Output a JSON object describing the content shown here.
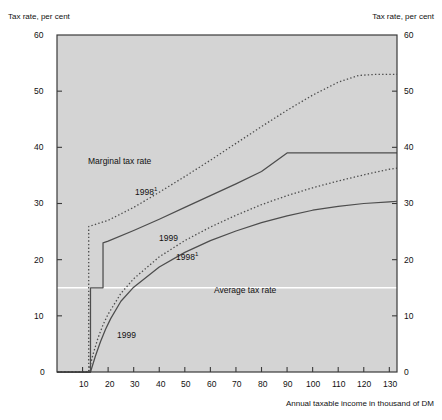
{
  "figure": {
    "y_axis_title_left": "Tax rate, per cent",
    "y_axis_title_right": "Tax rate, per cent",
    "x_axis_title": "Annual taxable income in thousand of DM"
  },
  "annotations": {
    "marginal_group": "Marginal tax rate",
    "marginal_1998": "1998",
    "marginal_1998_sup": "1",
    "marginal_1999": "1999",
    "average_1998": "1998",
    "average_1998_sup": "1",
    "average_group": "Average tax rate",
    "average_1999": "1999"
  },
  "colors": {
    "plot_background": "#d4d4d4",
    "line": "#4d4d4d",
    "axis": "#3a3a3a",
    "gridline": "#ffffff",
    "text": "#111111"
  },
  "chart_data": {
    "type": "line",
    "title": "",
    "xlabel": "Annual taxable income in thousand of DM",
    "ylabel": "Tax rate, per cent",
    "xlim": [
      0,
      133
    ],
    "ylim": [
      0,
      60
    ],
    "xticks": [
      10,
      20,
      30,
      40,
      50,
      60,
      70,
      80,
      90,
      100,
      110,
      120,
      130
    ],
    "yticks": [
      0,
      10,
      20,
      30,
      40,
      50,
      60
    ],
    "grid": "single white horizontal line at y = 15",
    "gridlines_y": [
      15
    ],
    "legend": "inline annotations",
    "series": [
      {
        "name": "Marginal tax rate 1998",
        "style": "dotted",
        "x": [
          0,
          12.4,
          12.4,
          20,
          30,
          40,
          50,
          60,
          70,
          80,
          90,
          100,
          110,
          118,
          125,
          133
        ],
        "values": [
          0,
          0,
          25.9,
          27.0,
          29.3,
          32.0,
          34.8,
          37.7,
          40.7,
          43.7,
          46.6,
          49.3,
          51.6,
          52.8,
          53.0,
          53.0
        ]
      },
      {
        "name": "Marginal tax rate 1999",
        "style": "solid",
        "x": [
          0,
          13.1,
          13.1,
          18.0,
          18.0,
          20,
          30,
          40,
          50,
          60,
          70,
          80,
          90,
          100,
          110,
          120,
          133
        ],
        "values": [
          0,
          0,
          15.0,
          15.0,
          23.0,
          23.3,
          25.2,
          27.2,
          29.3,
          31.4,
          33.5,
          35.7,
          39.0,
          39.0,
          39.0,
          39.0,
          39.0
        ]
      },
      {
        "name": "Average tax rate 1998",
        "style": "dotted",
        "x": [
          0,
          12.4,
          14,
          16,
          18,
          20,
          25,
          30,
          40,
          50,
          60,
          70,
          80,
          90,
          100,
          110,
          120,
          130,
          133
        ],
        "values": [
          0,
          0,
          3.0,
          6.0,
          8.4,
          10.3,
          14.0,
          16.6,
          20.5,
          23.4,
          25.8,
          27.9,
          29.8,
          31.4,
          32.8,
          34.0,
          35.1,
          36.1,
          36.3
        ]
      },
      {
        "name": "Average tax rate 1999",
        "style": "solid",
        "x": [
          0,
          13.1,
          15,
          17,
          19,
          21,
          25,
          30,
          40,
          50,
          60,
          70,
          80,
          90,
          100,
          110,
          120,
          130,
          133
        ],
        "values": [
          0,
          0,
          2.8,
          5.4,
          7.6,
          9.5,
          12.6,
          15.1,
          18.7,
          21.3,
          23.4,
          25.1,
          26.6,
          27.8,
          28.8,
          29.5,
          30.0,
          30.3,
          30.4
        ]
      }
    ]
  }
}
